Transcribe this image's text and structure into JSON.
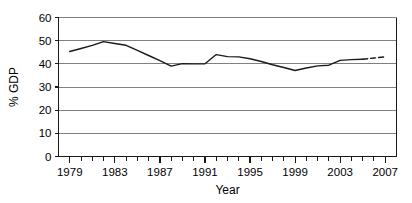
{
  "chart_data": {
    "type": "line",
    "title": "",
    "xlabel": "Year",
    "ylabel": "% GDP",
    "xlim": [
      1978,
      2008
    ],
    "ylim": [
      0,
      60
    ],
    "yticks": [
      0,
      10,
      20,
      30,
      40,
      50,
      60
    ],
    "ytick_labels": [
      "0",
      "10",
      "20",
      "30",
      "40",
      "50",
      "60"
    ],
    "xticks": [
      1979,
      1983,
      1987,
      1991,
      1995,
      1999,
      2003,
      2007
    ],
    "xtick_labels": [
      "1979",
      "1983",
      "1987",
      "1991",
      "1995",
      "1999",
      "2003",
      "2007"
    ],
    "minor_xtick_interval": 1,
    "grid": "horizontal",
    "legend": "none",
    "line_color": "#1a1a1a",
    "grid_color": "#808080",
    "axis_color": "#1a1a1a",
    "series": [
      {
        "name": "% GDP",
        "style": "solid",
        "x": [
          1979,
          1980,
          1981,
          1982,
          1983,
          1984,
          1985,
          1986,
          1987,
          1988,
          1989,
          1990,
          1991,
          1992,
          1993,
          1994,
          1995,
          1996,
          1997,
          1998,
          1999,
          2000,
          2001,
          2002,
          2003,
          2004,
          2005
        ],
        "values": [
          45.3,
          46.6,
          48.0,
          49.6,
          48.8,
          48.0,
          45.8,
          43.6,
          41.4,
          39.0,
          40.1,
          40.0,
          40.0,
          44.0,
          43.1,
          43.0,
          42.2,
          41.0,
          39.6,
          38.4,
          37.1,
          38.2,
          39.1,
          39.4,
          41.5,
          41.8,
          42.0
        ]
      },
      {
        "name": "% GDP (projected)",
        "style": "dashed",
        "x": [
          2005,
          2006,
          2007
        ],
        "values": [
          42.0,
          42.5,
          43.0
        ]
      }
    ]
  }
}
